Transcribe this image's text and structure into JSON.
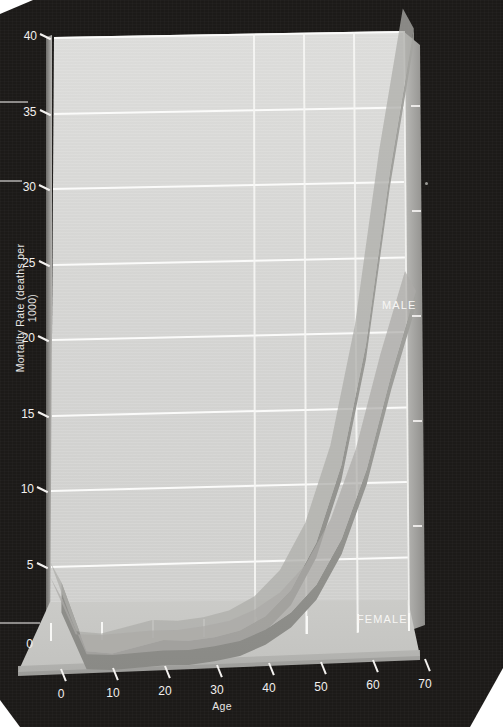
{
  "chart_data": {
    "type": "line",
    "title": "",
    "xlabel": "Age",
    "ylabel": "Mortality Rate (deaths per 1000)",
    "xlim": [
      0,
      70
    ],
    "ylim": [
      0,
      40
    ],
    "xticks": [
      0,
      10,
      20,
      30,
      40,
      50,
      60,
      70
    ],
    "yticks": [
      0,
      5,
      10,
      15,
      20,
      25,
      30,
      35,
      40
    ],
    "grid": true,
    "legend_position": "inline-annotation",
    "style": "3d-ribbon-area",
    "x": [
      0,
      5,
      10,
      15,
      20,
      25,
      30,
      35,
      40,
      45,
      50,
      55,
      60,
      65,
      70
    ],
    "series": [
      {
        "name": "MALE",
        "values": [
          5.2,
          0.6,
          0.4,
          0.8,
          1.2,
          1.1,
          1.3,
          1.7,
          2.6,
          4.3,
          7.4,
          12.5,
          20.5,
          32.0,
          41.5
        ]
      },
      {
        "name": "FEMALE",
        "values": [
          4.2,
          0.4,
          0.3,
          0.4,
          0.5,
          0.5,
          0.7,
          1.0,
          1.7,
          2.8,
          4.6,
          7.6,
          12.2,
          18.5,
          24.0
        ]
      }
    ],
    "annotations": [
      {
        "text": "MALE",
        "x": 60,
        "y": 22.5
      },
      {
        "text": "FEMALE",
        "x": 56,
        "y": 0.8
      }
    ],
    "colors": {
      "ribbon": "#9b9b97",
      "ribbon_shade": "#8a8a86",
      "panel": "#d5d5d3",
      "background": "#1c1a18",
      "gridline": "#fbfbfa",
      "text": "#f2f0ee"
    }
  },
  "axes": {
    "y_title": "Mortality Rate (deaths per 1000)",
    "x_title": "Age",
    "y_tick_labels": [
      "0",
      "5",
      "10",
      "15",
      "20",
      "25",
      "30",
      "35",
      "40"
    ],
    "x_tick_labels": [
      "0",
      "10",
      "20",
      "30",
      "40",
      "50",
      "60",
      "70"
    ]
  },
  "labels": {
    "male": "MALE",
    "female": "FEMALE"
  }
}
